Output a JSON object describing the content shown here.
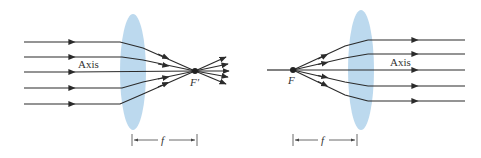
{
  "figure": {
    "type": "optics-ray-diagram",
    "colors": {
      "lens": "#bcd9ee",
      "ray": "#2b2b2b",
      "background": "#ffffff"
    }
  },
  "left_diagram": {
    "description": "Parallel rays converge through lens to focal point F'",
    "axis_label": "Axis",
    "focal_point_label": "F′",
    "focal_length_label": "f",
    "ray_count": 5,
    "ray_direction": "left-to-right, converging"
  },
  "right_diagram": {
    "description": "Rays diverging from focal point F emerge parallel from lens",
    "axis_label": "Axis",
    "focal_point_label": "F",
    "focal_length_label": "f",
    "ray_count": 5,
    "ray_direction": "left-to-right, collimated"
  }
}
